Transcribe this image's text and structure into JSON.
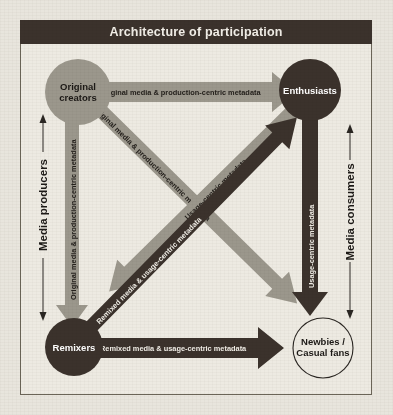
{
  "title": "Architecture of participation",
  "colors": {
    "page_background": "#e8e5dd",
    "panel_background": "#edeae2",
    "title_bar": "#3b322c",
    "title_text": "#f2efe8",
    "dark_element": "#3b322c",
    "light_element": "#9b978c",
    "outline": "#6b6558"
  },
  "nodes": [
    {
      "id": "original-creators",
      "label": "Original creators",
      "lines": [
        "Original",
        "creators"
      ],
      "style": "gray-filled",
      "position": "top-left"
    },
    {
      "id": "enthusiasts",
      "label": "Enthusiasts",
      "lines": [
        "Enthusiasts"
      ],
      "style": "dark-filled",
      "position": "top-right"
    },
    {
      "id": "remixers",
      "label": "Remixers",
      "lines": [
        "Remixers"
      ],
      "style": "dark-filled",
      "position": "bottom-left"
    },
    {
      "id": "newbies-casual-fans",
      "label": "Newbies / Casual fans",
      "lines": [
        "Newbies /",
        "Casual fans"
      ],
      "style": "white-outline",
      "position": "bottom-right"
    }
  ],
  "flows": [
    {
      "id": "creators-to-enthusiasts",
      "from": "Original creators",
      "to": "Enthusiasts",
      "label": "Original media & production-centric metadata",
      "style": "light",
      "direction": "horizontal-right"
    },
    {
      "id": "creators-to-remixers",
      "from": "Original creators",
      "to": "Remixers",
      "label": "Original media & production-centric metadata",
      "style": "light",
      "direction": "vertical-down"
    },
    {
      "id": "creators-to-newbies",
      "from": "Original creators",
      "to": "Newbies / Casual fans",
      "label": "Original media & production-centric metadata",
      "style": "light",
      "direction": "diagonal-down-right"
    },
    {
      "id": "remixers-to-newbies",
      "from": "Remixers",
      "to": "Newbies / Casual fans",
      "label": "Remixed media & usage-centric metadata",
      "style": "dark",
      "direction": "horizontal-right"
    },
    {
      "id": "remixers-to-enthusiasts",
      "from": "Remixers",
      "to": "Enthusiasts",
      "label": "Remixed media & usage-centric metadata",
      "style": "dark",
      "direction": "diagonal-up-right"
    },
    {
      "id": "enthusiasts-to-newbies",
      "from": "Enthusiasts",
      "to": "Newbies / Casual fans",
      "label": "Usage-centric metadata",
      "style": "dark",
      "direction": "vertical-down"
    },
    {
      "id": "enthusiasts-to-remixers",
      "from": "Enthusiasts",
      "to": "Remixers",
      "label": "Usage-centric metadata",
      "style": "light",
      "direction": "diagonal-down-left"
    }
  ],
  "side_labels": [
    {
      "id": "media-producers",
      "text": "Media producers",
      "side": "left"
    },
    {
      "id": "media-consumers",
      "text": "Media consumers",
      "side": "right"
    }
  ]
}
